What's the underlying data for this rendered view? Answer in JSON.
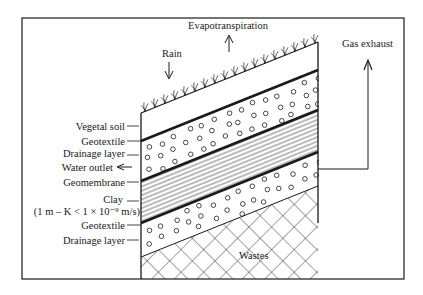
{
  "labels": {
    "evapotranspiration": "Evapotranspiration",
    "rain": "Rain",
    "gas_exhaust": "Gas exhaust",
    "wastes": "Wastes",
    "water_outlet": "Water outlet"
  },
  "layers": [
    {
      "id": "vegetal-soil",
      "label": "Vegetal soil"
    },
    {
      "id": "geotextile-top",
      "label": "Geotextile"
    },
    {
      "id": "drainage-layer-top",
      "label": "Drainage layer"
    },
    {
      "id": "geomembrane",
      "label": "Geomembrane"
    },
    {
      "id": "clay",
      "label": "Clay",
      "sublabel": "(1 m – K < 1 × 10⁻⁹ m/s)"
    },
    {
      "id": "geotextile-bottom",
      "label": "Geotextile"
    },
    {
      "id": "drainage-layer-bottom",
      "label": "Drainage layer"
    }
  ],
  "colors": {
    "ink": "#1a1a1a",
    "background": "#ffffff"
  }
}
